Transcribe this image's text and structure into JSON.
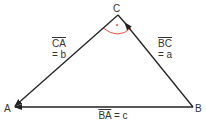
{
  "diagram": {
    "type": "vector-triangle",
    "vertices": {
      "A": {
        "label": "A",
        "x": 14,
        "y": 107
      },
      "B": {
        "label": "B",
        "x": 193,
        "y": 107
      },
      "C": {
        "label": "C",
        "x": 118,
        "y": 15
      }
    },
    "edges": [
      {
        "from": "C",
        "to": "A",
        "vector": "CA",
        "eq": "= b",
        "name": "b"
      },
      {
        "from": "B",
        "to": "C",
        "vector": "BC",
        "eq": "= a",
        "name": "a"
      },
      {
        "from": "B",
        "to": "A",
        "vector": "BA",
        "eq": "= c",
        "name": "c"
      }
    ],
    "labels": {
      "A": "A",
      "B": "B",
      "C": "C",
      "ca_vec": "CA",
      "ca_eq": "= b",
      "bc_vec": "BC",
      "bc_eq": "= a",
      "ba_vec": "BA",
      "ba_eq": "= c"
    },
    "angle_marker": {
      "vertex": "C",
      "color": "#e8503a"
    },
    "line_color": "#222222"
  }
}
